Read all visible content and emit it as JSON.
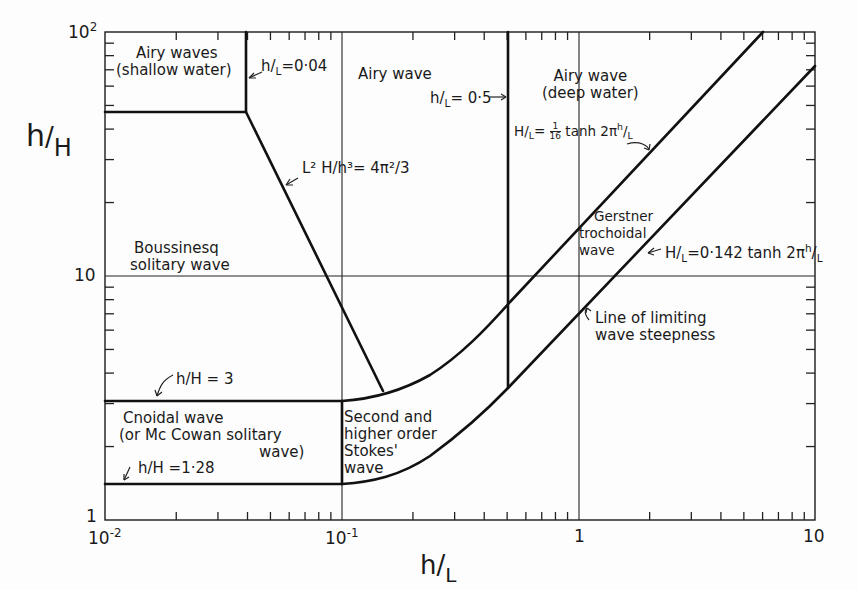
{
  "figure": {
    "type": "regime-diagram",
    "x_axis": {
      "label_num": "h",
      "label_den": "L",
      "scale": "log",
      "range": [
        0.01,
        10
      ],
      "ticks": [
        {
          "value": 0.01,
          "label_base": "10",
          "label_exp": "-2"
        },
        {
          "value": 0.1,
          "label_base": "10",
          "label_exp": "-1"
        },
        {
          "value": 1,
          "label_base": "1",
          "label_exp": ""
        },
        {
          "value": 10,
          "label_base": "10",
          "label_exp": ""
        }
      ]
    },
    "y_axis": {
      "label_num": "h",
      "label_den": "H",
      "scale": "log",
      "range": [
        1,
        100
      ],
      "ticks": [
        {
          "value": 1,
          "label_base": "1",
          "label_exp": ""
        },
        {
          "value": 10,
          "label_base": "10",
          "label_exp": ""
        },
        {
          "value": 100,
          "label_base": "10",
          "label_exp": "2"
        }
      ]
    },
    "regions": {
      "airy_shallow": {
        "line1": "Airy waves",
        "line2": "(shallow water)"
      },
      "airy": {
        "line1": "Airy wave"
      },
      "airy_deep": {
        "line1": "Airy wave",
        "line2": "(deep water)"
      },
      "boussinesq": {
        "line1": "Boussinesq",
        "line2": "solitary wave"
      },
      "cnoidal": {
        "line1": "Cnoidal wave",
        "line2": "(or Mc Cowan solitary",
        "line3": "wave)"
      },
      "stokes": {
        "line1": "Second and",
        "line2": "higher order",
        "line3": "Stokes'",
        "line4": "wave"
      },
      "gerstner": {
        "line1": "Gerstner",
        "line2": "trochoidal",
        "line3": "wave"
      }
    },
    "annotations": {
      "hl_004": {
        "num": "h",
        "den": "L",
        "rhs": "=0·04"
      },
      "hl_05": {
        "num": "h",
        "den": "L",
        "rhs": "= 0·5"
      },
      "ursell": {
        "text": "L² H/h³= 4π²/3"
      },
      "gerstner_limit": {
        "lhs_num": "H",
        "lhs_den": "L",
        "eq": "=",
        "frac_num": "1",
        "frac_den": "16",
        "rhs": " tanh 2π",
        "rhs_num": "h",
        "rhs_den": "L"
      },
      "steepness_limit": {
        "lhs_num": "H",
        "lhs_den": "L",
        "rhs": "=0·142 tanh  2π",
        "rhs_num": "h",
        "rhs_den": "L"
      },
      "limiting_line": {
        "line1": "Line of limiting",
        "line2": "wave steepness"
      },
      "hH_3": {
        "text": "h/H = 3"
      },
      "hH_128": {
        "text": "h/H =1·28"
      }
    },
    "boundaries": [
      {
        "name": "h/L = 0.04",
        "x": 0.04,
        "y_from": 47,
        "y_to": 100
      },
      {
        "name": "h/H = 47 (shallow-water box bottom)",
        "x_from": 0.01,
        "x_to": 0.04,
        "y": 47
      },
      {
        "name": "L^2 H/h^3 = 4pi^2/3",
        "from": [
          0.04,
          47
        ],
        "to": [
          0.15,
          3.2
        ]
      },
      {
        "name": "h/L = 0.5",
        "x": 0.5,
        "y_from": 3.3,
        "y_to": 100
      },
      {
        "name": "h/H = 3",
        "x_from": 0.01,
        "x_to": 0.1,
        "y": 3
      },
      {
        "name": "h/H = 1.28",
        "x_from": 0.01,
        "x_to": 0.1,
        "y": 1.28
      },
      {
        "name": "h/L = 0.1",
        "x": 0.1,
        "y_from": 1.28,
        "y_to": 3
      }
    ],
    "curves": [
      {
        "name": "H/L = 1/16 tanh 2pi h/L",
        "points": [
          [
            0.1,
            3.0
          ],
          [
            0.15,
            3.25
          ],
          [
            0.25,
            4.3
          ],
          [
            0.4,
            6.6
          ],
          [
            0.5,
            8.1
          ],
          [
            1,
            16
          ],
          [
            2,
            32
          ],
          [
            5.5,
            100
          ]
        ]
      },
      {
        "name": "H/L = 0.142 tanh 2pi h/L (limiting steepness)",
        "points": [
          [
            0.1,
            1.28
          ],
          [
            0.15,
            1.45
          ],
          [
            0.25,
            1.95
          ],
          [
            0.4,
            2.9
          ],
          [
            0.5,
            3.45
          ],
          [
            1,
            7.1
          ],
          [
            2,
            14.1
          ],
          [
            5,
            35
          ],
          [
            10,
            70
          ]
        ]
      }
    ]
  }
}
